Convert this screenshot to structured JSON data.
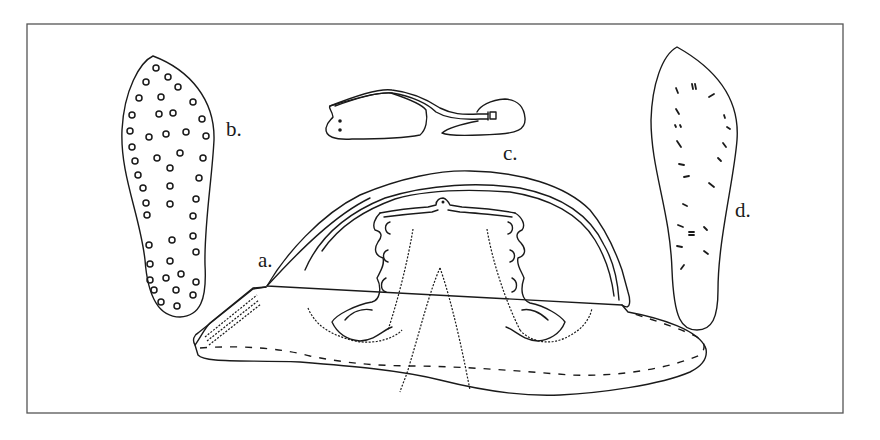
{
  "figure": {
    "frame": {
      "stroke": "#555555"
    },
    "labels": {
      "a": "a.",
      "b": "b.",
      "c": "c.",
      "d": "d."
    },
    "parts": [
      {
        "id": "a",
        "description": "shoe upper with decorative cutouts"
      },
      {
        "id": "b",
        "description": "sole with circular perforations"
      },
      {
        "id": "c",
        "description": "heel piece with strap"
      },
      {
        "id": "d",
        "description": "sole with stitch marks"
      }
    ]
  }
}
